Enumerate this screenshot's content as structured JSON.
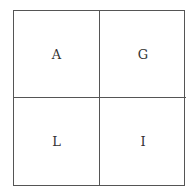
{
  "grid": {
    "cells": [
      {
        "label": "A"
      },
      {
        "label": "G"
      },
      {
        "label": "L"
      },
      {
        "label": "I"
      }
    ]
  }
}
